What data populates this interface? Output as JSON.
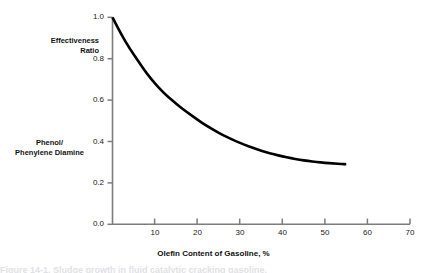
{
  "figure": {
    "axis_color": "#7d7d7d",
    "curve_color": "#000000",
    "background": "#ffffff",
    "bottom_clipped_caption": "Figure 14-1. Sludge growth in fluid catalytic cracking gasoline."
  },
  "labels": {
    "effectiveness_line1": "Effectiveness",
    "effectiveness_line2": "Ratio",
    "phenol_line1": "Phenol/",
    "phenol_line2": "Phenylene Diamine"
  },
  "chart_data": {
    "type": "line",
    "title": "",
    "xlabel": "Olefin Content of Gasoline, %",
    "ylabel": "Effectiveness Ratio",
    "ylabel_secondary": "Phenol/ Phenylene Diamine",
    "xlim": [
      0,
      70
    ],
    "ylim": [
      0.0,
      1.0
    ],
    "grid": false,
    "legend": "none",
    "xticks": [
      0,
      10,
      20,
      30,
      40,
      50,
      60,
      70
    ],
    "xtick_labels": [
      "",
      "10",
      "20",
      "30",
      "40",
      "50",
      "60",
      "70"
    ],
    "yticks": [
      0.0,
      0.2,
      0.4,
      0.6,
      0.8,
      1.0
    ],
    "ytick_labels": [
      "0.0",
      "0.2",
      "0.4",
      "0.6",
      "0.8",
      "1.0"
    ],
    "series": [
      {
        "name": "Effectiveness Ratio",
        "x": [
          0,
          2,
          4,
          6,
          8,
          10,
          12,
          14,
          16,
          18,
          20,
          22,
          24,
          26,
          28,
          30,
          32,
          34,
          36,
          38,
          40,
          42,
          44,
          46,
          48,
          50,
          52,
          54,
          55
        ],
        "y": [
          1.0,
          0.92,
          0.85,
          0.79,
          0.73,
          0.68,
          0.635,
          0.6,
          0.565,
          0.535,
          0.505,
          0.478,
          0.453,
          0.431,
          0.411,
          0.393,
          0.377,
          0.362,
          0.349,
          0.338,
          0.328,
          0.319,
          0.312,
          0.306,
          0.301,
          0.297,
          0.294,
          0.291,
          0.29
        ]
      }
    ]
  }
}
